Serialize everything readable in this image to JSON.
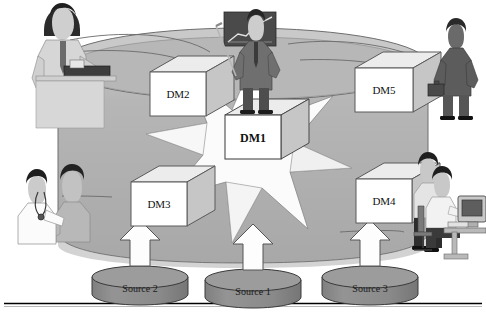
{
  "figure": {
    "type": "diagram",
    "background_color": "#ffffff",
    "frame_line_color": "#000000"
  },
  "enterprise_region": {
    "name": "enterprise-oval",
    "fill_color": "#b0b0b0",
    "edge_color": "#6e6e6e",
    "top_band_fill": "#c9c9c9"
  },
  "star": {
    "name": "central-starburst",
    "points": 4,
    "fill_color": "#fbfbfb",
    "edge_color": "#8a8a8a"
  },
  "cubes": [
    {
      "id": "dm2",
      "label": "DM2",
      "x": 150,
      "y": 72,
      "w": 56,
      "h": 44,
      "emphasis": false
    },
    {
      "id": "dm5",
      "label": "DM5",
      "x": 355,
      "y": 68,
      "w": 58,
      "h": 44,
      "emphasis": false
    },
    {
      "id": "dm1",
      "label": "DM1",
      "x": 253,
      "y": 131,
      "w": 56,
      "h": 44,
      "emphasis": true
    },
    {
      "id": "dm3",
      "label": "DM3",
      "x": 131,
      "y": 182,
      "w": 56,
      "h": 44,
      "emphasis": false
    },
    {
      "id": "dm4",
      "label": "DM4",
      "x": 356,
      "y": 179,
      "w": 56,
      "h": 44,
      "emphasis": false
    }
  ],
  "cube_style": {
    "face_fill": "#ffffff",
    "top_fill": "#ececec",
    "side_fill": "#c6c6c6",
    "edge_color": "#5a5a5a"
  },
  "sources": [
    {
      "id": "source2",
      "label": "Source 2",
      "cx": 140,
      "cy": 277,
      "rx": 48,
      "ry": 11,
      "height": 30
    },
    {
      "id": "source1",
      "label": "Source 1",
      "cx": 253,
      "cy": 280,
      "rx": 48,
      "ry": 11,
      "height": 30
    },
    {
      "id": "source3",
      "label": "Source 3",
      "cx": 370,
      "cy": 277,
      "rx": 48,
      "ry": 11,
      "height": 30
    }
  ],
  "source_style": {
    "body_fill": "#8e8e8e",
    "top_fill": "#9c9c9c",
    "edge_color": "#3a3a3a"
  },
  "arrows": [
    {
      "id": "arrow-source2-dm3",
      "cx": 140,
      "y_top": 222,
      "y_bottom": 264,
      "from": "Source 2",
      "to": "DM3"
    },
    {
      "id": "arrow-source1-dm1",
      "cx": 253,
      "y_top": 226,
      "y_bottom": 268,
      "from": "Source 1",
      "to": "DM1"
    },
    {
      "id": "arrow-source3-dm4",
      "cx": 370,
      "y_top": 222,
      "y_bottom": 264,
      "from": "Source 3",
      "to": "DM4"
    }
  ],
  "arrow_style": {
    "fill": "#fdfdfd",
    "edge_color": "#555555"
  },
  "people": [
    {
      "id": "clerk-at-counter",
      "description": "man in shirt and tie operating a desktop scanner at a counter",
      "position": "top-left"
    },
    {
      "id": "executive-golfer",
      "description": "businessman in suit holding a golf club in front of a rising-trend chart panel",
      "position": "top-center"
    },
    {
      "id": "commuter-briefcase",
      "description": "person in dark suit walking with a briefcase",
      "position": "top-right"
    },
    {
      "id": "doctor-patient",
      "description": "doctor with stethoscope examining a seated patient",
      "position": "bottom-left"
    },
    {
      "id": "office-workers",
      "description": "two colleagues at a desk with a CRT computer monitor",
      "position": "bottom-right"
    }
  ],
  "connector_lines": {
    "name": "connector-curves",
    "color": "#6a6a6a",
    "description": "thin curved lines linking the outer people to the enterprise oval and cubes"
  }
}
